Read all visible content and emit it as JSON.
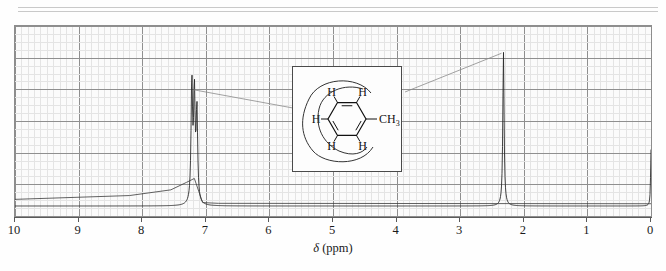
{
  "figure": {
    "kind": "nmr-spectrum",
    "compound": "toluene",
    "xlabel_symbol": "δ",
    "xlabel_units": "(ppm)"
  },
  "axis": {
    "ticks": [
      10,
      9,
      8,
      7,
      6,
      5,
      4,
      3,
      2,
      1,
      0
    ],
    "min_ppm": 0,
    "max_ppm": 10,
    "direction": "reversed"
  },
  "inset": {
    "labels": {
      "h_ortho_left": "H",
      "h_ortho_right": "H",
      "h_para": "H",
      "h_meta_left": "H",
      "h_meta_right": "H",
      "methyl": "CH",
      "methyl_sub": "3"
    }
  },
  "chart_data": {
    "type": "line",
    "title": "",
    "xlabel": "δ (ppm)",
    "ylabel": "",
    "xlim": [
      10,
      0
    ],
    "ylim": [
      0,
      1
    ],
    "grid": true,
    "legend": "none",
    "series": [
      {
        "name": "1H NMR spectrum",
        "peaks": [
          {
            "label": "aromatic H (multiplet)",
            "ppm": 7.22,
            "rel_height": 0.72,
            "assignment": "C6H5",
            "integration": 5
          },
          {
            "label": "aromatic H (multiplet)",
            "ppm": 7.18,
            "rel_height": 0.64,
            "assignment": "C6H5",
            "integration": 5
          },
          {
            "label": "aromatic H (multiplet)",
            "ppm": 7.14,
            "rel_height": 0.55,
            "assignment": "C6H5",
            "integration": 5
          },
          {
            "label": "methyl singlet",
            "ppm": 2.32,
            "rel_height": 0.93,
            "assignment": "CH3",
            "integration": 3
          },
          {
            "label": "TMS reference",
            "ppm": 0.0,
            "rel_height": 0.34,
            "assignment": "TMS",
            "integration": 0
          }
        ]
      },
      {
        "name": "integration trace",
        "steps": [
          {
            "ppm": 10.0,
            "level": 0.035
          },
          {
            "ppm": 7.6,
            "level": 0.055
          },
          {
            "ppm": 7.3,
            "level": 0.105
          },
          {
            "ppm": 7.05,
            "level": 0.015
          },
          {
            "ppm": 0.0,
            "level": 0.012
          }
        ]
      }
    ],
    "annotations": [
      {
        "text": "leader-line from aromatic peak to inset structure",
        "from_ppm": 7.22,
        "to": "inset-left"
      },
      {
        "text": "leader-line from CH3 label to methyl peak",
        "from": "inset-ch3",
        "to_ppm": 2.32
      }
    ]
  }
}
